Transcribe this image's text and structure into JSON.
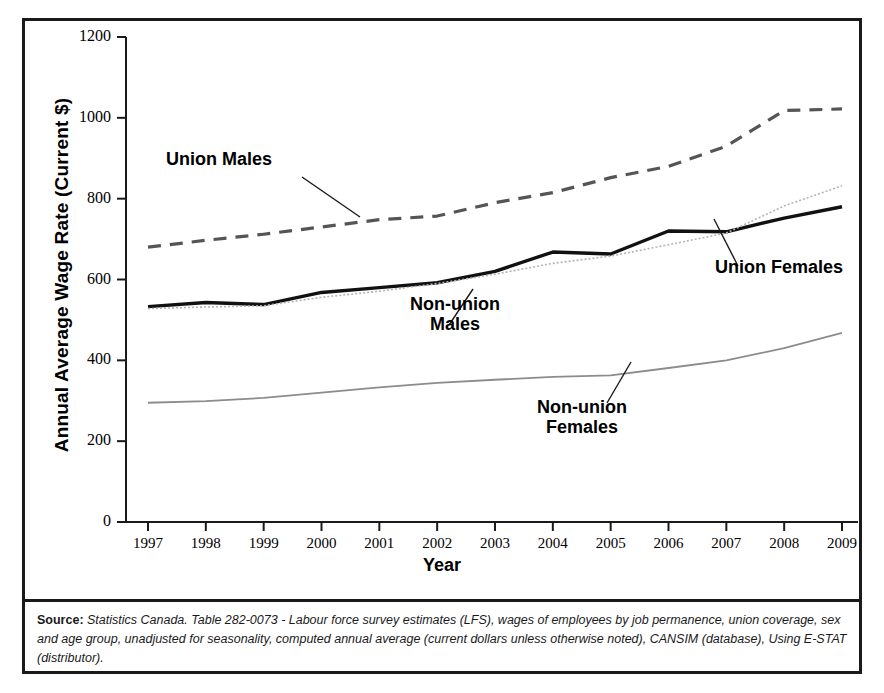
{
  "figure": {
    "y_axis_title": "Annual Average Wage Rate (Current $)",
    "x_axis_title": "Year"
  },
  "source": {
    "label": "Source:",
    "text": " Statistics Canada. Table 282-0073 - Labour force survey estimates (LFS), wages of employees by job permanence, union coverage, sex and age group, unadjusted for seasonality, computed annual average (current dollars unless otherwise noted), CANSIM (database), Using E-STAT (distributor)."
  },
  "annotations": {
    "union_males": "Union Males",
    "union_females": "Union Females",
    "non_union_males_l1": "Non-union",
    "non_union_males_l2": "Males",
    "non_union_females_l1": "Non-union",
    "non_union_females_l2": "Females"
  },
  "chart_data": {
    "type": "line",
    "title": "",
    "xlabel": "Year",
    "ylabel": "Annual Average Wage Rate (Current $)",
    "x": [
      1997,
      1998,
      1999,
      2000,
      2001,
      2002,
      2003,
      2004,
      2005,
      2006,
      2007,
      2008,
      2009
    ],
    "xlim": [
      1997,
      2009
    ],
    "ylim": [
      0,
      1200
    ],
    "yticks": [
      0,
      200,
      400,
      600,
      800,
      1000,
      1200
    ],
    "xticks": [
      "1997",
      "1998",
      "1999",
      "2000",
      "2001",
      "2002",
      "2003",
      "2004",
      "2005",
      "2006",
      "2007",
      "2008",
      "2009"
    ],
    "grid": false,
    "legend": "inline-annotations",
    "series": [
      {
        "name": "Union Males",
        "style": "dashed",
        "color": "#555555",
        "values": [
          680,
          697,
          712,
          730,
          748,
          757,
          790,
          815,
          852,
          880,
          930,
          1018,
          1022
        ]
      },
      {
        "name": "Union Females",
        "style": "solid",
        "color": "#111111",
        "values": [
          533,
          543,
          538,
          568,
          580,
          592,
          620,
          668,
          663,
          720,
          718,
          752,
          780
        ]
      },
      {
        "name": "Non-union Males",
        "style": "dotted",
        "color": "#b4b4b4",
        "values": [
          528,
          532,
          535,
          556,
          571,
          590,
          613,
          640,
          658,
          686,
          715,
          782,
          832
        ]
      },
      {
        "name": "Non-union Females",
        "style": "thin-solid",
        "color": "#8c8c8c",
        "values": [
          295,
          299,
          307,
          320,
          333,
          344,
          352,
          359,
          363,
          381,
          400,
          430,
          468
        ]
      }
    ]
  }
}
